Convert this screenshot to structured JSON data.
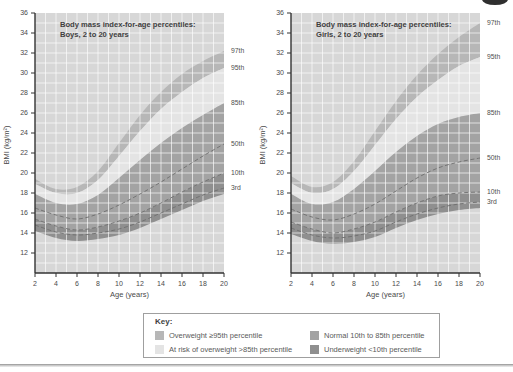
{
  "colors": {
    "plot_bg": "#d7d7d7",
    "grid": "rgba(255,255,255,0.65)",
    "band_overweight": "#b7b7b7",
    "band_at_risk": "#e4e4e4",
    "band_normal": "#a3a3a3",
    "band_underweight": "#8f8f8f",
    "axis": "#333333",
    "curve_dashed": "#6e6e6e",
    "title_text": "#3f3f3f",
    "tick_text": "#4a4a4a",
    "label_text": "#4f4f4f"
  },
  "key": {
    "title": "Key:",
    "items": [
      {
        "label": "Overweight ≥95th percentile",
        "color": "#b7b7b7"
      },
      {
        "label": "At risk of overweight >85th percentile",
        "color": "#e4e4e4"
      },
      {
        "label": "Normal 10th to 85th percentile",
        "color": "#a3a3a3"
      },
      {
        "label": "Underweight <10th percentile",
        "color": "#8f8f8f"
      }
    ]
  },
  "chart_data": [
    {
      "type": "area",
      "title": "Body mass index-for-age percentiles:",
      "subtitle": "Boys, 2 to 20 years",
      "xlabel": "Age (years)",
      "ylabel": "BMI (kg/m²)",
      "x": [
        2,
        4,
        6,
        8,
        10,
        12,
        14,
        16,
        18,
        20
      ],
      "xlim": [
        2,
        20
      ],
      "ylim": [
        10,
        36
      ],
      "xticks": [
        2,
        4,
        6,
        8,
        10,
        12,
        14,
        16,
        18,
        20
      ],
      "yticks": [
        12,
        14,
        16,
        18,
        20,
        22,
        24,
        26,
        28,
        30,
        32,
        34,
        36
      ],
      "grid": "on",
      "legend_position": "right",
      "series": [
        {
          "name": "97th",
          "style": "band-edge",
          "values": [
            19.4,
            18.4,
            18.6,
            20.2,
            23.0,
            25.8,
            28.1,
            29.9,
            31.2,
            32.2
          ]
        },
        {
          "name": "95th",
          "style": "band-edge",
          "values": [
            18.9,
            18.0,
            18.0,
            19.3,
            21.7,
            24.2,
            26.4,
            28.1,
            29.5,
            30.5
          ]
        },
        {
          "name": "85th",
          "style": "band-edge",
          "values": [
            17.9,
            17.0,
            16.9,
            17.8,
            19.5,
            21.3,
            23.0,
            24.5,
            25.8,
            27.0
          ]
        },
        {
          "name": "50th",
          "style": "dashed",
          "values": [
            16.5,
            15.8,
            15.4,
            15.9,
            16.8,
            17.9,
            19.1,
            20.4,
            21.7,
            22.9
          ]
        },
        {
          "name": "10th",
          "style": "dashed",
          "values": [
            15.4,
            14.7,
            14.3,
            14.6,
            15.2,
            16.0,
            17.0,
            18.1,
            19.1,
            20.0
          ]
        },
        {
          "name": "3rd",
          "style": "dashed",
          "values": [
            14.8,
            14.1,
            13.8,
            14.0,
            14.4,
            15.1,
            16.0,
            16.9,
            17.8,
            18.5
          ]
        }
      ],
      "band_floor": [
        14.2,
        13.5,
        13.2,
        13.4,
        13.8,
        14.5,
        15.4,
        16.3,
        17.2,
        17.9
      ],
      "bands": [
        {
          "name": "overweight",
          "upper": "97th",
          "lower": "95th"
        },
        {
          "name": "at_risk",
          "upper": "95th",
          "lower": "85th"
        },
        {
          "name": "normal",
          "upper": "85th",
          "lower": "10th"
        },
        {
          "name": "underweight",
          "upper": "10th",
          "lower": "floor"
        }
      ]
    },
    {
      "type": "area",
      "title": "Body mass index-for-age percentiles:",
      "subtitle": "Girls, 2 to 20 years",
      "xlabel": "Age (years)",
      "ylabel": "BMI (kg/m²)",
      "x": [
        2,
        4,
        6,
        8,
        10,
        12,
        14,
        16,
        18,
        20
      ],
      "xlim": [
        2,
        20
      ],
      "ylim": [
        10,
        36
      ],
      "xticks": [
        2,
        4,
        6,
        8,
        10,
        12,
        14,
        16,
        18,
        20
      ],
      "yticks": [
        12,
        14,
        16,
        18,
        20,
        22,
        24,
        26,
        28,
        30,
        32,
        34,
        36
      ],
      "grid": "on",
      "legend_position": "right",
      "series": [
        {
          "name": "97th",
          "style": "band-edge",
          "values": [
            19.7,
            18.6,
            19.1,
            21.2,
            24.2,
            27.2,
            29.8,
            31.9,
            33.6,
            35.0
          ]
        },
        {
          "name": "95th",
          "style": "band-edge",
          "values": [
            19.0,
            18.0,
            18.4,
            20.2,
            22.8,
            25.4,
            27.6,
            29.3,
            30.7,
            31.6
          ]
        },
        {
          "name": "85th",
          "style": "band-edge",
          "values": [
            17.9,
            16.9,
            17.1,
            18.4,
            20.2,
            22.1,
            23.7,
            24.9,
            25.6,
            26.0
          ]
        },
        {
          "name": "50th",
          "style": "dashed",
          "values": [
            16.4,
            15.6,
            15.3,
            15.9,
            16.9,
            18.2,
            19.5,
            20.5,
            21.1,
            21.5
          ]
        },
        {
          "name": "10th",
          "style": "dashed",
          "values": [
            15.1,
            14.4,
            14.0,
            14.4,
            15.1,
            16.1,
            17.0,
            17.7,
            18.0,
            18.1
          ]
        },
        {
          "name": "3rd",
          "style": "dashed",
          "values": [
            14.5,
            13.8,
            13.5,
            13.7,
            14.2,
            15.1,
            15.9,
            16.5,
            16.9,
            17.1
          ]
        }
      ],
      "band_floor": [
        13.9,
        13.2,
        12.9,
        13.1,
        13.6,
        14.5,
        15.3,
        15.9,
        16.3,
        16.5
      ],
      "bands": [
        {
          "name": "overweight",
          "upper": "97th",
          "lower": "95th"
        },
        {
          "name": "at_risk",
          "upper": "95th",
          "lower": "85th"
        },
        {
          "name": "normal",
          "upper": "85th",
          "lower": "10th"
        },
        {
          "name": "underweight",
          "upper": "10th",
          "lower": "floor"
        }
      ]
    }
  ]
}
